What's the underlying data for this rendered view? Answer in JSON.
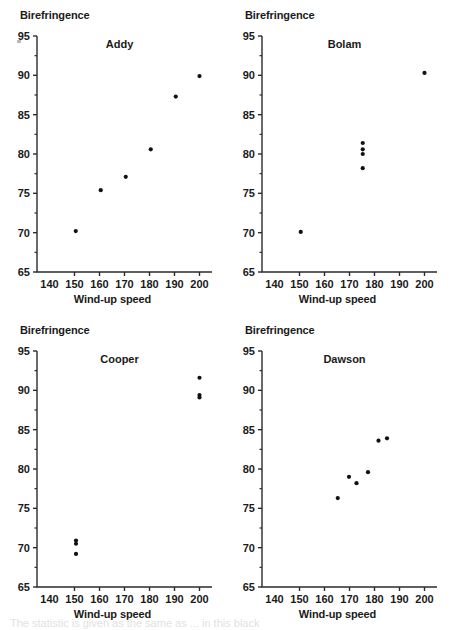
{
  "figure": {
    "background": "#ffffff",
    "point_color": "#111111",
    "axis_color": "#2b2b2b",
    "footer_partial_text": "The statistic is given as the same as ... in this black"
  },
  "axes": {
    "y_title": "Birefringence",
    "x_title": "Wind-up speed",
    "x_ticks": [
      140,
      150,
      160,
      170,
      180,
      190,
      200
    ],
    "y_ticks": [
      65,
      70,
      75,
      80,
      85,
      90,
      95
    ],
    "xlim": [
      135,
      205
    ],
    "ylim": [
      65,
      95
    ]
  },
  "chart_data": [
    {
      "type": "scatter",
      "title": "Addy",
      "xlabel": "Wind-up speed",
      "ylabel": "Birefringence",
      "xlim": [
        135,
        205
      ],
      "ylim": [
        65,
        95
      ],
      "xticks": [
        140,
        150,
        160,
        170,
        180,
        190,
        200
      ],
      "yticks": [
        65,
        70,
        75,
        80,
        85,
        90,
        95
      ],
      "grid": false,
      "legend": "none",
      "points": [
        {
          "x": 150.5,
          "y": 70.2
        },
        {
          "x": 160.5,
          "y": 75.4
        },
        {
          "x": 170.5,
          "y": 77.1
        },
        {
          "x": 180.5,
          "y": 80.6
        },
        {
          "x": 190.5,
          "y": 87.3
        },
        {
          "x": 200.0,
          "y": 89.9
        }
      ]
    },
    {
      "type": "scatter",
      "title": "Bolam",
      "xlabel": "Wind-up speed",
      "ylabel": "Birefringence",
      "xlim": [
        135,
        205
      ],
      "ylim": [
        65,
        95
      ],
      "xticks": [
        140,
        150,
        160,
        170,
        180,
        190,
        200
      ],
      "yticks": [
        65,
        70,
        75,
        80,
        85,
        90,
        95
      ],
      "grid": false,
      "legend": "none",
      "points": [
        {
          "x": 150.5,
          "y": 70.1
        },
        {
          "x": 175.3,
          "y": 78.2
        },
        {
          "x": 175.3,
          "y": 80.0
        },
        {
          "x": 175.3,
          "y": 80.6
        },
        {
          "x": 175.3,
          "y": 81.4
        },
        {
          "x": 200.0,
          "y": 90.3
        }
      ]
    },
    {
      "type": "scatter",
      "title": "Cooper",
      "xlabel": "Wind-up speed",
      "ylabel": "Birefringence",
      "xlim": [
        135,
        205
      ],
      "ylim": [
        65,
        95
      ],
      "xticks": [
        140,
        150,
        160,
        170,
        180,
        190,
        200
      ],
      "yticks": [
        65,
        70,
        75,
        80,
        85,
        90,
        95
      ],
      "grid": false,
      "legend": "none",
      "points": [
        {
          "x": 150.6,
          "y": 69.2
        },
        {
          "x": 150.6,
          "y": 70.5
        },
        {
          "x": 150.6,
          "y": 70.9
        },
        {
          "x": 200.0,
          "y": 89.1
        },
        {
          "x": 200.0,
          "y": 89.4
        },
        {
          "x": 200.0,
          "y": 91.6
        }
      ]
    },
    {
      "type": "scatter",
      "title": "Dawson",
      "xlabel": "Wind-up speed",
      "ylabel": "Birefringence",
      "xlim": [
        135,
        205
      ],
      "ylim": [
        65,
        95
      ],
      "xticks": [
        140,
        150,
        160,
        170,
        180,
        190,
        200
      ],
      "yticks": [
        65,
        70,
        75,
        80,
        85,
        90,
        95
      ],
      "grid": false,
      "legend": "none",
      "points": [
        {
          "x": 165.3,
          "y": 76.3
        },
        {
          "x": 169.8,
          "y": 79.0
        },
        {
          "x": 172.8,
          "y": 78.2
        },
        {
          "x": 177.4,
          "y": 79.6
        },
        {
          "x": 181.6,
          "y": 83.6
        },
        {
          "x": 185.0,
          "y": 83.9
        }
      ]
    }
  ],
  "panels": [
    {
      "name": "addy",
      "label": "Addy"
    },
    {
      "name": "bolam",
      "label": "Bolam"
    },
    {
      "name": "cooper",
      "label": "Cooper"
    },
    {
      "name": "dawson",
      "label": "Dawson"
    }
  ]
}
